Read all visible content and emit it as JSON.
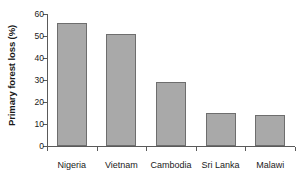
{
  "chart_data": {
    "type": "bar",
    "title": "",
    "subtitle": "",
    "xlabel": "",
    "ylabel": "Primary forest loss (%)",
    "categories": [
      "Nigeria",
      "Vietnam",
      "Cambodia",
      "Sri Lanka",
      "Malawi"
    ],
    "values": [
      56,
      51,
      29,
      15,
      14
    ],
    "series": [
      {
        "name": "Primary forest loss",
        "values": [
          56,
          51,
          29,
          15,
          14
        ]
      }
    ],
    "ylim": [
      0,
      60
    ],
    "ytick_labels": [
      "0",
      "10",
      "20",
      "30",
      "40",
      "50",
      "60"
    ],
    "ytick_values": [
      0,
      10,
      20,
      30,
      40,
      50,
      60
    ],
    "grid": false,
    "legend": false,
    "legend_position": "none",
    "bar_color": "#a9a9a9",
    "bar_border_color": "#6e6e6e",
    "axis_color": "#5a5a5a",
    "text_color": "#1a1a1a",
    "background_color": "#ffffff"
  }
}
